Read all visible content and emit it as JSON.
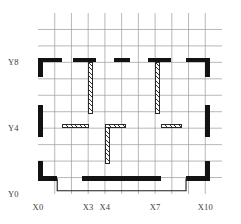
{
  "drawing": {
    "title": "Structural floor plan grid",
    "grid": {
      "columns": 11,
      "rows": 11,
      "line_color": "#9a9a9a",
      "border_color": "#6f6f6f",
      "cell_width": 16.73,
      "cell_height": 16.45
    },
    "colors": {
      "solid_wall": "#121212",
      "hatch_wall_outline": "#2a2a2a",
      "hatch_wall_fill": "#fdfdfd",
      "grid_line": "#9a9a9a",
      "label_text": "#3c3c3c",
      "outline_stroke": "#1c1c1c",
      "background": "#ffffff"
    },
    "axes": {
      "x_labels": [
        {
          "text": "X0",
          "grid_x": 0
        },
        {
          "text": "X3",
          "grid_x": 3
        },
        {
          "text": "X4",
          "grid_x": 4
        },
        {
          "text": "X7",
          "grid_x": 7
        },
        {
          "text": "X10",
          "grid_x": 10
        }
      ],
      "y_labels": [
        {
          "text": "Y8",
          "grid_y": 8
        },
        {
          "text": "Y4",
          "grid_y": 4
        },
        {
          "text": "Y0",
          "grid_y": 0
        }
      ]
    },
    "walls_solid": [
      {
        "id": "ext-top-left-horizontal",
        "x": 0,
        "y": 8,
        "w": 1.45,
        "h": 0.28
      },
      {
        "id": "ext-top-left-vertical",
        "x": 0,
        "y": 7.1,
        "w": 0.28,
        "h": 1.18
      },
      {
        "id": "ext-top-bay2-horizontal",
        "x": 2.1,
        "y": 8,
        "w": 1.35,
        "h": 0.28
      },
      {
        "id": "ext-top-mid-horizontal",
        "x": 4.55,
        "y": 8,
        "w": 0.95,
        "h": 0.28
      },
      {
        "id": "ext-top-bay4-horizontal",
        "x": 6.55,
        "y": 8,
        "w": 1.4,
        "h": 0.28
      },
      {
        "id": "ext-top-right-horizontal",
        "x": 8.85,
        "y": 8,
        "w": 1.43,
        "h": 0.28
      },
      {
        "id": "ext-top-right-vertical",
        "x": 10,
        "y": 7.1,
        "w": 0.28,
        "h": 1.18
      },
      {
        "id": "ext-left-mid-vertical",
        "x": 0,
        "y": 3.45,
        "w": 0.28,
        "h": 1.95
      },
      {
        "id": "ext-right-mid-vertical",
        "x": 10,
        "y": 3.45,
        "w": 0.28,
        "h": 1.95
      },
      {
        "id": "ext-left-bottom-vertical",
        "x": 0,
        "y": 0.82,
        "w": 0.28,
        "h": 1.2
      },
      {
        "id": "ext-bottom-left-horizontal",
        "x": 0,
        "y": 0.82,
        "w": 1.15,
        "h": 0.28
      },
      {
        "id": "ext-bottom-mid-horizontal",
        "x": 2.62,
        "y": 0.82,
        "w": 4.72,
        "h": 0.28
      },
      {
        "id": "ext-bottom-right-horizontal",
        "x": 8.85,
        "y": 0.82,
        "w": 1.43,
        "h": 0.28
      },
      {
        "id": "ext-right-bottom-vertical",
        "x": 10,
        "y": 0.82,
        "w": 0.28,
        "h": 1.2
      }
    ],
    "walls_hatched": [
      {
        "id": "partition-x3-upper-vertical",
        "x": 3,
        "y": 4.85,
        "w": 0.3,
        "h": 3.2
      },
      {
        "id": "partition-x7-upper-vertical",
        "x": 7,
        "y": 4.85,
        "w": 0.3,
        "h": 3.2
      },
      {
        "id": "partition-left-y4-horizontal",
        "x": 1.45,
        "y": 4,
        "w": 1.6,
        "h": 0.26
      },
      {
        "id": "partition-mid-y4-horizontal",
        "x": 4,
        "y": 4,
        "w": 1.25,
        "h": 0.26
      },
      {
        "id": "partition-right-y4-horizontal",
        "x": 7.35,
        "y": 4,
        "w": 1.25,
        "h": 0.26
      },
      {
        "id": "partition-x4-lower-vertical",
        "x": 4,
        "y": 1.8,
        "w": 0.3,
        "h": 2.25
      }
    ],
    "slab_outline": {
      "id": "bottom-slab-edge",
      "points": [
        [
          1.15,
          0.95
        ],
        [
          1.15,
          0.2
        ],
        [
          8.85,
          0.2
        ],
        [
          8.85,
          0.95
        ]
      ]
    }
  }
}
